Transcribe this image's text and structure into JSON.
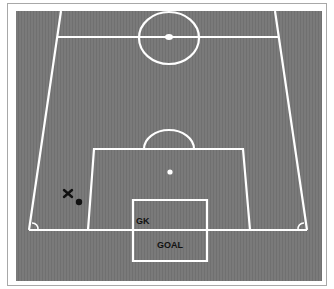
{
  "diagram": {
    "type": "soccer-pitch-half-perspective",
    "colors": {
      "field": "#7a7a7a",
      "lines": "#ffffff",
      "frame_border": "#a8a8a8",
      "marker": "#111111"
    },
    "labels": {
      "goalkeeper": "GK",
      "goal": "GOAL"
    },
    "markers": [
      {
        "name": "player-x",
        "symbol": "X",
        "x": 68,
        "y": 194
      },
      {
        "name": "ball",
        "symbol": "dot",
        "x": 79,
        "y": 202
      }
    ]
  }
}
